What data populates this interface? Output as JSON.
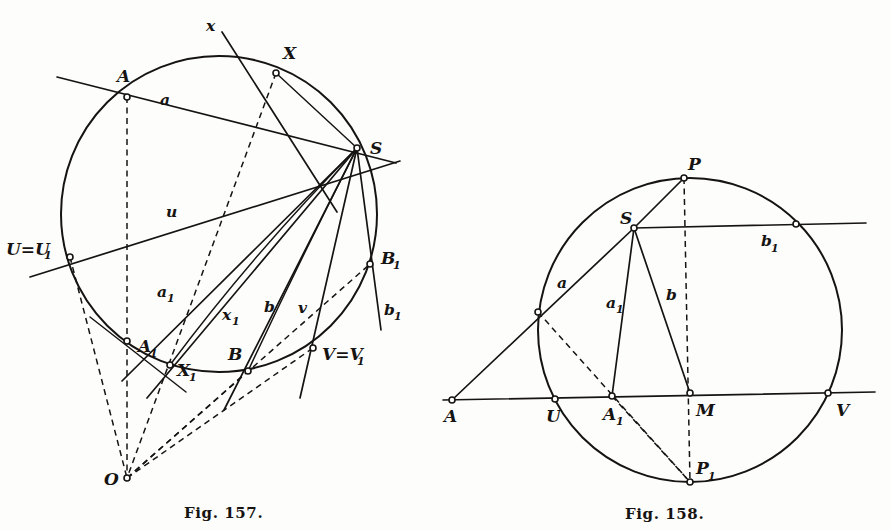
{
  "page": {
    "background_color": "#fdfdfb",
    "ink_color": "#161412",
    "width": 891,
    "height": 530
  },
  "figures": [
    {
      "id": "fig-157",
      "caption": "Fig. 157.",
      "caption_x": 184,
      "caption_y": 518,
      "circle": {
        "cx": 219,
        "cy": 214,
        "r": 158
      },
      "points": [
        {
          "name": "A",
          "label": "A",
          "x": 127,
          "y": 97,
          "lx": 117,
          "ly": 82
        },
        {
          "name": "X",
          "label": "X",
          "x": 276,
          "y": 73,
          "lx": 283,
          "ly": 59
        },
        {
          "name": "S",
          "label": "S",
          "x": 357,
          "y": 148,
          "lx": 370,
          "ly": 145
        },
        {
          "name": "U=U1",
          "label": "U=U",
          "x": 70,
          "y": 257,
          "lx": 6,
          "ly": 249
        },
        {
          "name": "B1",
          "label": "B",
          "x": 370,
          "y": 264,
          "lx": 381,
          "ly": 259
        },
        {
          "name": "A1",
          "label": "A",
          "x": 127,
          "y": 341,
          "lx": 139,
          "ly": 351
        },
        {
          "name": "X1",
          "label": "X",
          "x": 170,
          "y": 365,
          "lx": 177,
          "ly": 374
        },
        {
          "name": "B",
          "label": "B",
          "x": 248,
          "y": 371,
          "lx": 228,
          "ly": 358
        },
        {
          "name": "V=V1",
          "label": "V=V",
          "x": 313,
          "y": 348,
          "lx": 322,
          "ly": 358
        },
        {
          "name": "O",
          "label": "O",
          "x": 127,
          "y": 478,
          "lx": 105,
          "ly": 484
        }
      ],
      "line_labels": [
        {
          "name": "a",
          "label": "a",
          "x": 162,
          "y": 100
        },
        {
          "name": "u",
          "label": "u",
          "x": 168,
          "y": 212
        },
        {
          "name": "a1",
          "label": "a",
          "x": 158,
          "y": 292
        },
        {
          "name": "x1",
          "label": "x",
          "x": 224,
          "y": 315
        },
        {
          "name": "b",
          "label": "b",
          "x": 265,
          "y": 307
        },
        {
          "name": "v",
          "label": "v",
          "x": 300,
          "y": 308
        },
        {
          "name": "b1",
          "label": "b",
          "x": 385,
          "y": 310
        },
        {
          "name": "x",
          "label": "x",
          "x": 208,
          "y": 26
        }
      ],
      "subscripts": [
        {
          "for": "U=U1",
          "text": "1",
          "x": 40,
          "y": 253
        },
        {
          "for": "B1",
          "text": "1",
          "x": 392,
          "y": 263
        },
        {
          "for": "A1",
          "text": "1",
          "x": 150,
          "y": 355
        },
        {
          "for": "X1",
          "text": "1",
          "x": 188,
          "y": 378
        },
        {
          "for": "V=V1",
          "text": "1",
          "x": 355,
          "y": 362
        },
        {
          "for": "a1",
          "text": "1",
          "x": 168,
          "y": 297
        },
        {
          "for": "x1",
          "text": "1",
          "x": 234,
          "y": 320
        },
        {
          "for": "b1",
          "text": "1",
          "x": 395,
          "y": 315
        }
      ]
    },
    {
      "id": "fig-158",
      "caption": "Fig. 158.",
      "caption_x": 625,
      "caption_y": 519,
      "circle": {
        "cx": 690,
        "cy": 330,
        "r": 152
      },
      "points": [
        {
          "name": "P",
          "label": "P",
          "x": 684,
          "y": 178,
          "lx": 690,
          "ly": 165
        },
        {
          "name": "S",
          "label": "S",
          "x": 634,
          "y": 228,
          "lx": 621,
          "ly": 222
        },
        {
          "name": "b1-circ",
          "label": "",
          "x": 796,
          "y": 224,
          "lx": 0,
          "ly": 0
        },
        {
          "name": "a-circ",
          "label": "",
          "x": 538,
          "y": 312,
          "lx": 0,
          "ly": 0
        },
        {
          "name": "A",
          "label": "A",
          "x": 452,
          "y": 400,
          "lx": 445,
          "ly": 420
        },
        {
          "name": "U",
          "label": "U",
          "x": 555,
          "y": 399,
          "lx": 547,
          "ly": 420
        },
        {
          "name": "A1",
          "label": "A",
          "x": 612,
          "y": 396,
          "lx": 604,
          "ly": 418
        },
        {
          "name": "M",
          "label": "M",
          "x": 690,
          "y": 393,
          "lx": 697,
          "ly": 414
        },
        {
          "name": "V",
          "label": "V",
          "x": 828,
          "y": 393,
          "lx": 836,
          "ly": 414
        },
        {
          "name": "P1",
          "label": "P",
          "x": 690,
          "y": 482,
          "lx": 697,
          "ly": 472
        }
      ],
      "line_labels": [
        {
          "name": "a",
          "label": "a",
          "x": 560,
          "y": 283
        },
        {
          "name": "a1",
          "label": "a",
          "x": 608,
          "y": 303
        },
        {
          "name": "b",
          "label": "b",
          "x": 668,
          "y": 295
        },
        {
          "name": "b1",
          "label": "b",
          "x": 763,
          "y": 241
        }
      ],
      "subscripts": [
        {
          "for": "A1",
          "text": "1",
          "x": 616,
          "y": 423
        },
        {
          "for": "P1",
          "text": "1",
          "x": 708,
          "y": 478
        },
        {
          "for": "a1",
          "text": "1",
          "x": 618,
          "y": 308
        },
        {
          "for": "b1",
          "text": "1",
          "x": 772,
          "y": 247
        }
      ]
    }
  ]
}
